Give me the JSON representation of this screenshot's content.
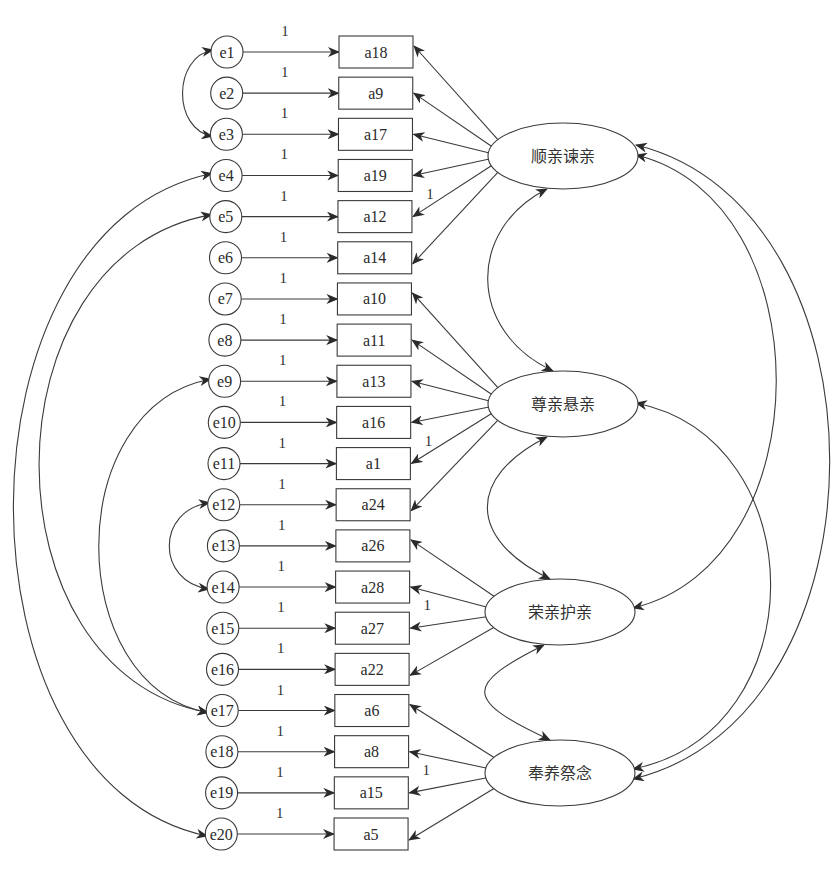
{
  "colors": {
    "stroke": "#3a3a3a",
    "text": "#2a2a2a",
    "background": "#ffffff"
  },
  "errors": [
    "e1",
    "e2",
    "e3",
    "e4",
    "e5",
    "e6",
    "e7",
    "e8",
    "e9",
    "e10",
    "e11",
    "e12",
    "e13",
    "e14",
    "e15",
    "e16",
    "e17",
    "e18",
    "e19",
    "e20"
  ],
  "indicators": [
    "a18",
    "a9",
    "a17",
    "a19",
    "a12",
    "a14",
    "a10",
    "a11",
    "a13",
    "a16",
    "a1",
    "a24",
    "a26",
    "a28",
    "a27",
    "a22",
    "a6",
    "a8",
    "a15",
    "a5"
  ],
  "error_weight_label": "1",
  "factors": [
    {
      "name": "顺亲谏亲",
      "indicators": [
        0,
        1,
        2,
        3,
        4,
        5
      ],
      "fixed_loading_index": 4,
      "fixed_loading_label": "1"
    },
    {
      "name": "尊亲悬亲",
      "indicators": [
        6,
        7,
        8,
        9,
        10,
        11
      ],
      "fixed_loading_index": 10,
      "fixed_loading_label": "1"
    },
    {
      "name": "荣亲护亲",
      "indicators": [
        12,
        13,
        14,
        15
      ],
      "fixed_loading_index": 14,
      "fixed_loading_label": "1"
    },
    {
      "name": "奉养祭念",
      "indicators": [
        16,
        17,
        18,
        19
      ],
      "fixed_loading_index": 18,
      "fixed_loading_label": "1"
    }
  ],
  "error_covariances": [
    [
      "e1",
      "e3"
    ],
    [
      "e4",
      "e20"
    ],
    [
      "e5",
      "e17"
    ],
    [
      "e9",
      "e17"
    ],
    [
      "e12",
      "e14"
    ]
  ],
  "factor_covariances": [
    [
      "顺亲谏亲",
      "尊亲悬亲"
    ],
    [
      "尊亲悬亲",
      "荣亲护亲"
    ],
    [
      "荣亲护亲",
      "奉养祭念"
    ],
    [
      "顺亲谏亲",
      "荣亲护亲"
    ],
    [
      "顺亲谏亲",
      "奉养祭念"
    ],
    [
      "尊亲悬亲",
      "奉养祭念"
    ]
  ]
}
